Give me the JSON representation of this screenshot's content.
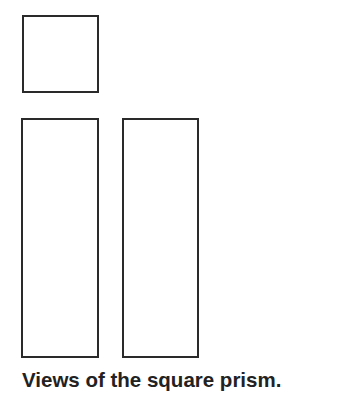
{
  "diagram": {
    "caption": "Views of the square prism.",
    "views": [
      {
        "name": "top-view",
        "shape": "square",
        "x": 22,
        "y": 15,
        "w": 77,
        "h": 78
      },
      {
        "name": "front-view",
        "shape": "rectangle",
        "x": 21,
        "y": 118,
        "w": 78,
        "h": 240
      },
      {
        "name": "side-view",
        "shape": "rectangle",
        "x": 122,
        "y": 118,
        "w": 77,
        "h": 240
      }
    ],
    "stroke_color": "#2a2a2a"
  }
}
